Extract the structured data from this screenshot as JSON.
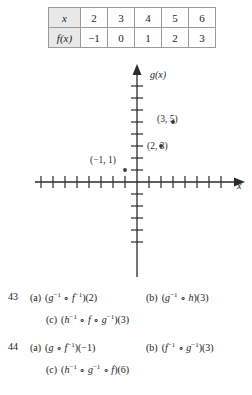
{
  "table": {
    "name": "function-value-table",
    "rows": [
      {
        "header": "x",
        "values": [
          "2",
          "3",
          "4",
          "5",
          "6"
        ]
      },
      {
        "header": "f(x)",
        "values": [
          "−1",
          "0",
          "1",
          "2",
          "3"
        ]
      }
    ]
  },
  "graph": {
    "y_axis_label": "g(x)",
    "x_axis_label": "x",
    "points": [
      {
        "label": "(3, 5)",
        "x": 3,
        "y": 5
      },
      {
        "label": "(2, 3)",
        "x": 2,
        "y": 3
      },
      {
        "label": "(−1, 1)",
        "x": -1,
        "y": 1
      }
    ],
    "x_ticks": [
      -8,
      -7,
      -6,
      -5,
      -4,
      -3,
      -2,
      -1,
      1,
      2,
      3,
      4,
      5,
      6,
      7
    ],
    "y_ticks": [
      -5,
      -4,
      -3,
      -2,
      -1,
      1,
      2,
      3,
      4,
      5,
      6,
      7
    ]
  },
  "exercises": [
    {
      "number": "43",
      "parts": [
        {
          "tag": "(a)",
          "expr_html": "(<i>g</i><sup>−1</sup> ∘ <i>f</i><sup>−1</sup>)(2)"
        },
        {
          "tag": "(b)",
          "expr_html": "(<i>g</i><sup>−1</sup> ∘ <i>h</i>)(3)"
        },
        {
          "tag": "(c)",
          "expr_html": "(<i>h</i><sup>−1</sup> ∘ <i>f</i> ∘ <i>g</i><sup>−1</sup>)(3)"
        }
      ]
    },
    {
      "number": "44",
      "parts": [
        {
          "tag": "(a)",
          "expr_html": "(<i>g</i> ∘ <i>f</i><sup>−1</sup>)(−1)"
        },
        {
          "tag": "(b)",
          "expr_html": "(<i>f</i><sup>−1</sup> ∘ <i>g</i><sup>−1</sup>)(3)"
        },
        {
          "tag": "(c)",
          "expr_html": "(<i>h</i><sup>−1</sup> ∘ <i>g</i><sup>−1</sup> ∘ <i>f</i>)(6)"
        }
      ]
    }
  ],
  "colors": {
    "ink": "#1a1a1a",
    "rule": "#9a9a9a",
    "header_fill": "#e8e8e8",
    "axis": "#2b2b2b"
  }
}
